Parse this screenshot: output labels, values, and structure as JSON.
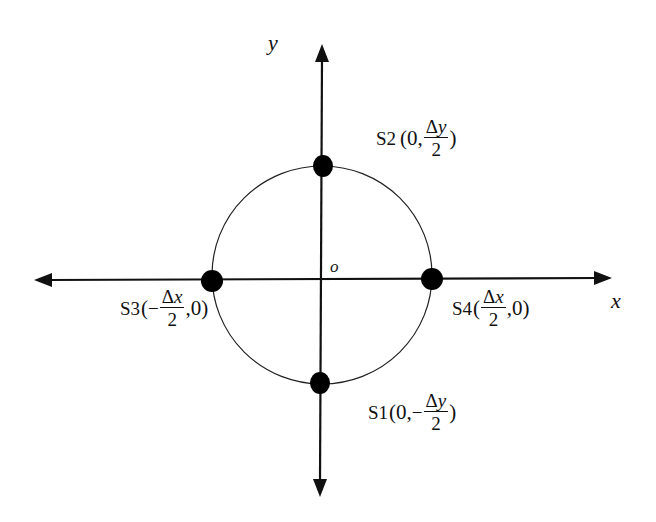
{
  "diagram": {
    "type": "coordinate-sensor-layout",
    "axes": {
      "x_label": "x",
      "y_label": "y",
      "origin_label": "o"
    },
    "circle": {
      "center": [
        322,
        279
      ],
      "rx": 110,
      "ry": 112
    },
    "points": [
      {
        "id": "S1",
        "name": "S1",
        "coord_prefix": "(0,",
        "sign": "−",
        "num_symbol": "Δ",
        "num_var": "y",
        "den": "2",
        "coord_suffix": ")",
        "px": [
          320,
          383
        ]
      },
      {
        "id": "S2",
        "name": "S2",
        "coord_prefix": "(0,",
        "sign": "",
        "num_symbol": "Δ",
        "num_var": "y",
        "den": "2",
        "coord_suffix": ")",
        "px": [
          323,
          166
        ]
      },
      {
        "id": "S3",
        "name": "S3",
        "coord_prefix": "(",
        "sign": "−",
        "num_symbol": "Δ",
        "num_var": "x",
        "den": "2",
        "coord_suffix": ",0)",
        "px": [
          212,
          281
        ]
      },
      {
        "id": "S4",
        "name": "S4",
        "coord_prefix": "(",
        "sign": "",
        "num_symbol": "Δ",
        "num_var": "x",
        "den": "2",
        "coord_suffix": ",0)",
        "px": [
          432,
          279
        ]
      }
    ],
    "colors": {
      "ink": "#111111",
      "background": "#ffffff"
    }
  }
}
